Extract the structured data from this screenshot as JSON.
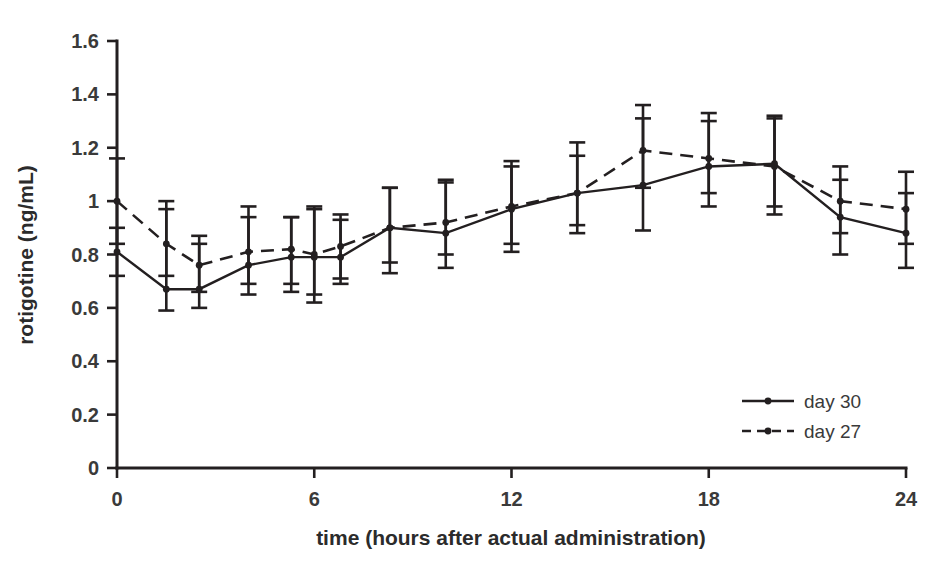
{
  "chart_data": {
    "type": "line",
    "title": "",
    "xlabel": "time (hours after actual administration)",
    "ylabel": "rotigotine (ng/mL)",
    "xlim": [
      0,
      24
    ],
    "ylim": [
      0,
      1.6
    ],
    "xticks": [
      0,
      6,
      12,
      18,
      24
    ],
    "xticklabels": [
      "0",
      "6",
      "12",
      "18",
      "24"
    ],
    "yticks": [
      0,
      0.2,
      0.4,
      0.6,
      0.8,
      1,
      1.2,
      1.4,
      1.6
    ],
    "yticklabels": [
      "0",
      "0.2",
      "0.4",
      "0.6",
      "0.8",
      "1",
      "1.2",
      "1.4",
      "1.6"
    ],
    "grid": false,
    "legend_position": "lower-right",
    "error_bars": "symmetric (SD)",
    "x": [
      0,
      1.5,
      2.5,
      4,
      5.3,
      6,
      6.8,
      8.3,
      10,
      12,
      14,
      16,
      18,
      20,
      22,
      24
    ],
    "series": [
      {
        "name": "day 30",
        "style": "solid",
        "marker": "filled-circle",
        "values": [
          0.81,
          0.67,
          0.67,
          0.76,
          0.79,
          0.79,
          0.79,
          0.9,
          0.88,
          0.97,
          1.03,
          1.06,
          1.13,
          1.14,
          0.94,
          0.88
        ],
        "err_low": [
          0.09,
          0.08,
          0.07,
          0.11,
          0.13,
          0.17,
          0.1,
          0.17,
          0.13,
          0.16,
          0.15,
          0.17,
          0.15,
          0.19,
          0.14,
          0.13
        ],
        "err_high": [
          0.09,
          0.3,
          0.17,
          0.22,
          0.15,
          0.18,
          0.14,
          0.15,
          0.2,
          0.18,
          0.19,
          0.25,
          0.17,
          0.18,
          0.14,
          0.15
        ]
      },
      {
        "name": "day 27",
        "style": "dashed",
        "marker": "filled-circle",
        "values": [
          1.0,
          0.84,
          0.76,
          0.81,
          0.82,
          0.8,
          0.83,
          0.9,
          0.92,
          0.98,
          1.03,
          1.19,
          1.16,
          1.13,
          1.0,
          0.97
        ],
        "err_low": [
          0.16,
          0.12,
          0.1,
          0.12,
          0.13,
          0.15,
          0.12,
          0.13,
          0.12,
          0.14,
          0.12,
          0.14,
          0.13,
          0.15,
          0.12,
          0.13
        ],
        "err_high": [
          0.16,
          0.16,
          0.11,
          0.13,
          0.12,
          0.18,
          0.12,
          0.15,
          0.15,
          0.15,
          0.14,
          0.17,
          0.17,
          0.18,
          0.13,
          0.14
        ]
      }
    ]
  },
  "legend": {
    "items": [
      {
        "label": "day 30",
        "style": "solid"
      },
      {
        "label": "day 27",
        "style": "dashed"
      }
    ]
  }
}
